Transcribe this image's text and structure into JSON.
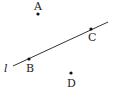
{
  "diagram": {
    "line": {
      "name": "l",
      "x1": 13,
      "y1": 66,
      "x2": 108,
      "y2": 22,
      "color": "#333333"
    },
    "points": [
      {
        "label": "A",
        "x": 38,
        "y": 14,
        "lx": 34,
        "ly": 10
      },
      {
        "label": "B",
        "x": 29,
        "y": 59,
        "lx": 26,
        "ly": 72
      },
      {
        "label": "C",
        "x": 91,
        "y": 29,
        "lx": 88,
        "ly": 41
      },
      {
        "label": "D",
        "x": 71,
        "y": 73,
        "lx": 67,
        "ly": 87
      }
    ],
    "line_label": {
      "text": "l",
      "x": 4,
      "y": 72
    }
  }
}
